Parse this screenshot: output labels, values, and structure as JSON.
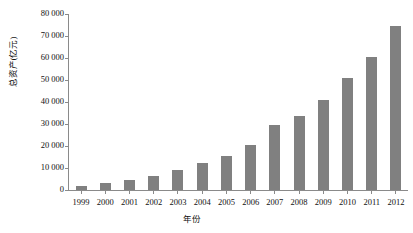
{
  "chart_data": {
    "type": "bar",
    "title": "",
    "xlabel": "年份",
    "ylabel": "总资产(亿元)",
    "ylim": [
      0,
      80000
    ],
    "ytick_step": 10000,
    "grid": false,
    "legend": null,
    "bar_color": "#808080",
    "axis_color": "#8a8a8a",
    "background": "#ffffff",
    "ytick_labels": [
      "80 000",
      "70 000",
      "60 000",
      "50 000",
      "40 000",
      "30 000",
      "20 000",
      "10 000",
      "0"
    ],
    "ytick_values": [
      80000,
      70000,
      60000,
      50000,
      40000,
      30000,
      20000,
      10000,
      0
    ],
    "categories": [
      "1999",
      "2000",
      "2001",
      "2002",
      "2003",
      "2004",
      "2005",
      "2006",
      "2007",
      "2008",
      "2009",
      "2010",
      "2011",
      "2012"
    ],
    "values": [
      2000,
      3000,
      4500,
      6500,
      9000,
      12500,
      15500,
      20500,
      29500,
      33500,
      41000,
      51000,
      60500,
      74500
    ],
    "series": [
      {
        "name": "总资产(亿元)",
        "values": [
          2000,
          3000,
          4500,
          6500,
          9000,
          12500,
          15500,
          20500,
          29500,
          33500,
          41000,
          51000,
          60500,
          74500
        ]
      }
    ]
  }
}
